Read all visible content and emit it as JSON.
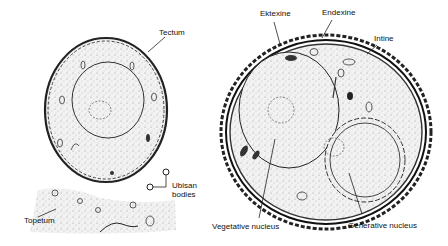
{
  "figure": {
    "left_panel": {
      "labels": {
        "tectum": "Tectum",
        "ubisch_line1": "Ubisan",
        "ubisch_line2": "bodies",
        "tapetum": "Topetum"
      }
    },
    "right_panel": {
      "labels": {
        "ektexine": "Ektexine",
        "endexine": "Endexine",
        "intine": "Intine",
        "vegetative_nucleus": "Vegetative nucleus",
        "generative_nucleus": "Generative nucleus"
      }
    },
    "colors": {
      "ink": "#1a1a1a",
      "stipple": "#e6e6e6",
      "background": "#ffffff"
    }
  }
}
